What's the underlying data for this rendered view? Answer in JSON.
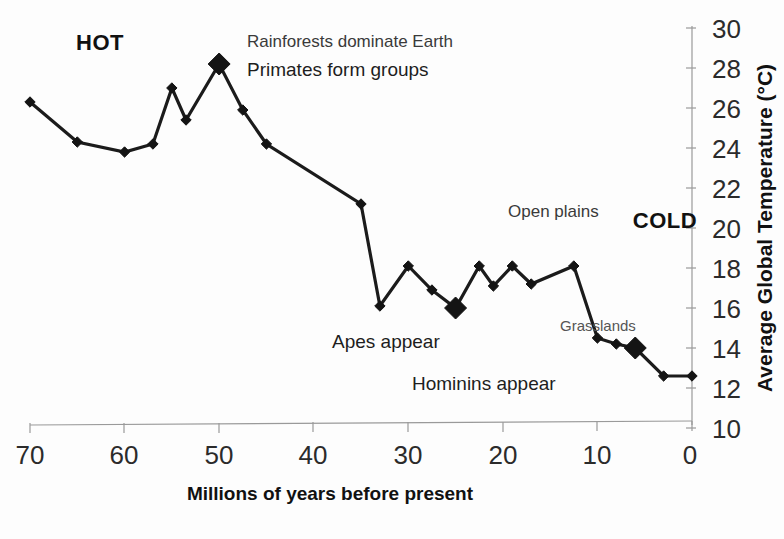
{
  "chart_data": {
    "type": "line",
    "title": "",
    "xlabel": "Millions of years before present",
    "ylabel": "Average Global Temperature (°C)",
    "xlim": [
      70,
      0
    ],
    "ylim": [
      10,
      30
    ],
    "x_ticks": [
      70,
      60,
      50,
      40,
      30,
      20,
      10,
      0
    ],
    "y_ticks": [
      10,
      12,
      14,
      16,
      18,
      20,
      22,
      24,
      26,
      28,
      30
    ],
    "x_axis_reversed": true,
    "y_axis_position": "right",
    "grid": false,
    "legend": null,
    "series": [
      {
        "name": "Average global temperature",
        "x": [
          70,
          65,
          60,
          57,
          55,
          53.5,
          50,
          47.5,
          45,
          35,
          33,
          30,
          27.5,
          25,
          22.5,
          21,
          19,
          17,
          12.5,
          10,
          8,
          6,
          3,
          0
        ],
        "values": [
          26.3,
          24.3,
          23.8,
          24.2,
          27.0,
          25.4,
          28.2,
          25.9,
          24.2,
          21.2,
          16.1,
          18.1,
          16.9,
          16.0,
          18.1,
          17.1,
          18.1,
          17.2,
          18.1,
          14.5,
          14.2,
          14.0,
          12.6,
          12.6
        ]
      }
    ],
    "emphasized_points": [
      {
        "x": 50,
        "y": 28.2,
        "label": "Rainforests dominate Earth / Primates form groups"
      },
      {
        "x": 25,
        "y": 16.0,
        "label": "Apes appear"
      },
      {
        "x": 6,
        "y": 14.0,
        "label": "Hominins appear"
      }
    ],
    "annotations": [
      {
        "id": "hot",
        "text": "HOT",
        "style": "bold"
      },
      {
        "id": "cold",
        "text": "COLD",
        "style": "bold"
      },
      {
        "id": "rainforests",
        "text": "Rainforests dominate Earth",
        "style": "plain"
      },
      {
        "id": "primates",
        "text": "Primates form groups",
        "style": "plain"
      },
      {
        "id": "open_plains",
        "text": "Open plains",
        "style": "plain"
      },
      {
        "id": "grasslands",
        "text": "Grasslands",
        "style": "plain"
      },
      {
        "id": "apes",
        "text": "Apes appear",
        "style": "plain"
      },
      {
        "id": "hominins",
        "text": "Hominins appear",
        "style": "plain"
      }
    ],
    "colors": {
      "line": "#1b1b1b",
      "marker": "#141414",
      "axis": "#9a9a9a",
      "text": "#1a1a1a",
      "background": "#ffffff"
    }
  },
  "labels": {
    "x_axis_title": "Millions of years before present",
    "y_axis_title": "Average Global Temperature (°C)",
    "hot": "HOT",
    "cold": "COLD",
    "rainforests": "Rainforests dominate Earth",
    "primates": "Primates form groups",
    "open_plains": "Open plains",
    "grasslands": "Grasslands",
    "apes_appear": "Apes appear",
    "hominins_appear": "Hominins appear",
    "x_ticks": [
      "70",
      "60",
      "50",
      "40",
      "30",
      "20",
      "10",
      "0"
    ],
    "y_ticks": [
      "30",
      "28",
      "26",
      "24",
      "22",
      "20",
      "18",
      "16",
      "14",
      "12",
      "10"
    ]
  }
}
